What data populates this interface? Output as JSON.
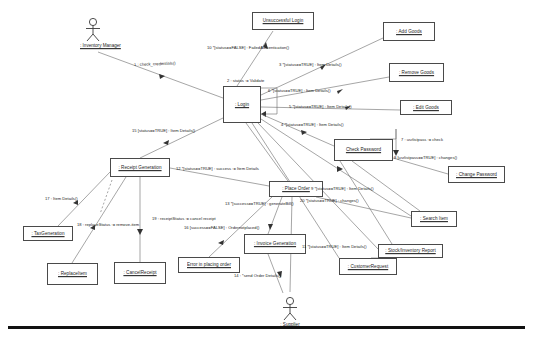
{
  "diagram": {
    "kind": "uml-communication-diagram",
    "actors": [
      {
        "id": "inventory-manager",
        "label": ": Inventory Manager",
        "x": 80,
        "y": 17
      },
      {
        "id": "supplier",
        "label": ": Supplier",
        "x": 277,
        "y": 296
      }
    ],
    "objects": [
      {
        "id": "unsuccessful-login",
        "label": "Unsuccessful Login",
        "x": 252,
        "y": 12,
        "w": 62,
        "h": 18
      },
      {
        "id": "add-goods",
        "label": ": Add Goods",
        "x": 383,
        "y": 22,
        "w": 52,
        "h": 19
      },
      {
        "id": "remove-goods",
        "label": ": Remove Goods",
        "x": 389,
        "y": 63,
        "w": 55,
        "h": 19
      },
      {
        "id": "edit-goods",
        "label": ": Edit Goods",
        "x": 400,
        "y": 100,
        "w": 52,
        "h": 15
      },
      {
        "id": "login",
        "label": ": Login",
        "x": 223,
        "y": 86,
        "w": 38,
        "h": 37
      },
      {
        "id": "check-password",
        "label": "Check Password",
        "x": 334,
        "y": 139,
        "w": 59,
        "h": 22
      },
      {
        "id": "change-password",
        "label": ": Change Password",
        "x": 448,
        "y": 166,
        "w": 57,
        "h": 17
      },
      {
        "id": "search-item",
        "label": ": Search Item",
        "x": 411,
        "y": 211,
        "w": 46,
        "h": 16
      },
      {
        "id": "stock-inventory-report",
        "label": ": Stock/Inventory Report",
        "x": 378,
        "y": 244,
        "w": 65,
        "h": 14
      },
      {
        "id": "receipt-generation",
        "label": ": Receipt Generation",
        "x": 110,
        "y": 158,
        "w": 60,
        "h": 19
      },
      {
        "id": "place-order",
        "label": ": Place Order",
        "x": 269,
        "y": 181,
        "w": 54,
        "h": 16
      },
      {
        "id": "tax-generation",
        "label": ": TaxGeneration",
        "x": 23,
        "y": 226,
        "w": 50,
        "h": 15
      },
      {
        "id": "replace-item",
        "label": ": ReplaceItem",
        "x": 47,
        "y": 263,
        "w": 51,
        "h": 22
      },
      {
        "id": "cancel-receipt",
        "label": ": CancelReceipt",
        "x": 114,
        "y": 262,
        "w": 52,
        "h": 22
      },
      {
        "id": "error-placing-order",
        "label": "Error in placing order",
        "x": 178,
        "y": 257,
        "w": 62,
        "h": 16
      },
      {
        "id": "invoice-generation",
        "label": ": Invoice Generation",
        "x": 244,
        "y": 234,
        "w": 62,
        "h": 20
      },
      {
        "id": "customer-request",
        "label": ": CustomerRequest",
        "x": 339,
        "y": 258,
        "w": 58,
        "h": 17
      }
    ],
    "messages": [
      {
        "id": "m1",
        "text": "1 : check_credentials()",
        "x": 134,
        "y": 62,
        "rotate": -2
      },
      {
        "id": "m2",
        "text": "2 : status := Validate",
        "x": 227,
        "y": 78,
        "rotate": 0
      },
      {
        "id": "m3",
        "text": "3 *[status==TRUE] : Item Details()",
        "x": 279,
        "y": 62,
        "rotate": 0
      },
      {
        "id": "m4",
        "text": "4 *[status==TRUE] : Item Details()",
        "x": 281,
        "y": 122,
        "rotate": 0
      },
      {
        "id": "m5",
        "text": "5 *[status==TRUE] : Item Details()",
        "x": 289,
        "y": 104,
        "rotate": 0
      },
      {
        "id": "m6",
        "text": "6 *[status==TRUE] : Item Details()",
        "x": 268,
        "y": 88,
        "rotate": 0
      },
      {
        "id": "m7",
        "text": "7 : usrlistpass := check",
        "x": 401,
        "y": 137,
        "rotate": 0
      },
      {
        "id": "m8",
        "text": "8 [usrlistpass==TRUE] : changes()",
        "x": 394,
        "y": 155,
        "rotate": 0
      },
      {
        "id": "m9",
        "text": "9 *[status==TRUE] : Item Details()",
        "x": 311,
        "y": 186,
        "rotate": 0
      },
      {
        "id": "m10",
        "text": "10 *[status==FALSE] : FailedAuthentication()",
        "x": 207,
        "y": 45,
        "rotate": 0
      },
      {
        "id": "m11",
        "text": "11 *[status==TRUE] : Item Details()",
        "x": 302,
        "y": 244,
        "rotate": 0
      },
      {
        "id": "m12",
        "text": "12 *[status==TRUE] : success := Item Details",
        "x": 176,
        "y": 166,
        "rotate": 0
      },
      {
        "id": "m13",
        "text": "13 *[success==TRUE] : generateBill()",
        "x": 225,
        "y": 201,
        "rotate": 0
      },
      {
        "id": "m14",
        "text": "14 : *send Order Details()",
        "x": 234,
        "y": 273,
        "rotate": 0
      },
      {
        "id": "m15",
        "text": "15 [status==TRUE] : Item Details()",
        "x": 132,
        "y": 128,
        "rotate": 0
      },
      {
        "id": "m16",
        "text": "16 [success==FALSE] : Ordernotplaced()",
        "x": 184,
        "y": 225,
        "rotate": 0
      },
      {
        "id": "m17",
        "text": "17 : Item Details()",
        "x": 45,
        "y": 196,
        "rotate": 0
      },
      {
        "id": "m18",
        "text": "18 : replaceStatus := remove-item",
        "x": 77,
        "y": 222,
        "rotate": 0
      },
      {
        "id": "m19",
        "text": "19 : receiptStatus := cancel receipt",
        "x": 152,
        "y": 216,
        "rotate": 0
      },
      {
        "id": "m20",
        "text": "20 *[status==TRUE] : changes()",
        "x": 300,
        "y": 198,
        "rotate": 0
      }
    ]
  }
}
